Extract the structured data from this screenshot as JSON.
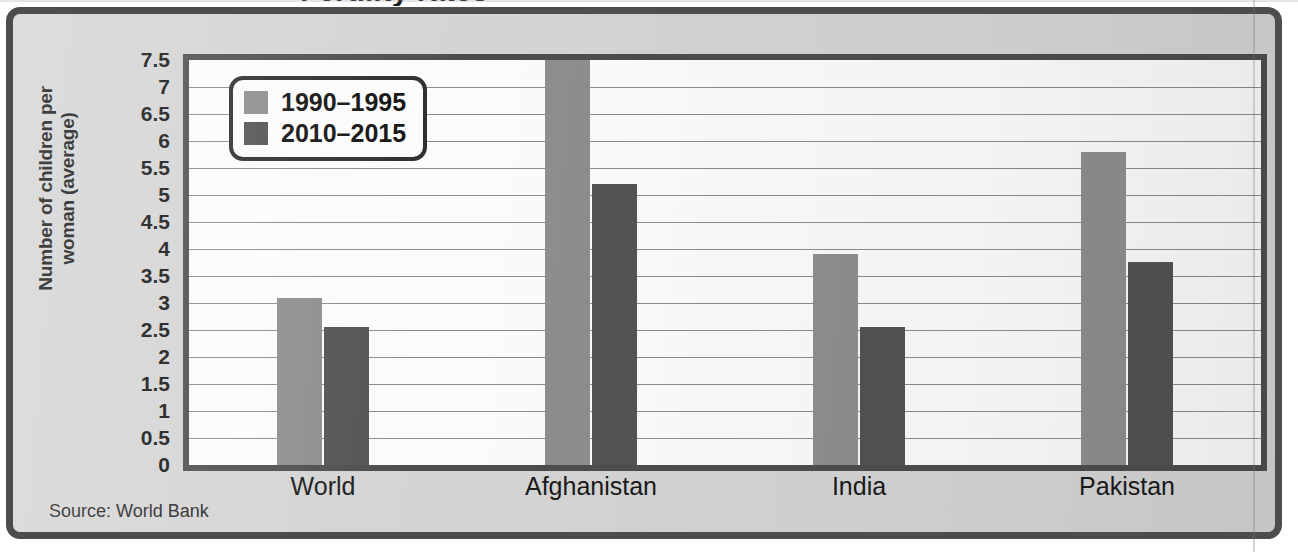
{
  "figure": {
    "clipped_title": "Fertility rates",
    "source_note": "Source: World Bank",
    "frame_color": "#4d4d4d",
    "panel_background": "#d4d4d4",
    "plot_background": "#fbfbfb"
  },
  "chart_data": {
    "type": "bar",
    "title": "",
    "xlabel": "",
    "ylabel": "Number of children per woman (average)",
    "ylabel_line1": "Number of children per",
    "ylabel_line2": "woman (average)",
    "categories": [
      "World",
      "Afghanistan",
      "India",
      "Pakistan"
    ],
    "series": [
      {
        "name": "1990–1995",
        "color": "#8e8e8e",
        "values": [
          3.1,
          7.7,
          3.9,
          5.8
        ]
      },
      {
        "name": "2010–2015",
        "color": "#535353",
        "values": [
          2.55,
          5.2,
          2.55,
          3.75
        ]
      }
    ],
    "ylim": [
      0,
      7.5
    ],
    "ytick_step": 0.5,
    "yticks": [
      "0",
      "0.5",
      "1",
      "1.5",
      "2",
      "2.5",
      "3",
      "3.5",
      "4",
      "4.5",
      "5",
      "5.5",
      "6",
      "6.5",
      "7",
      "7.5"
    ],
    "grid": true,
    "grid_axis": "y",
    "legend_position": "top-left-inside"
  }
}
